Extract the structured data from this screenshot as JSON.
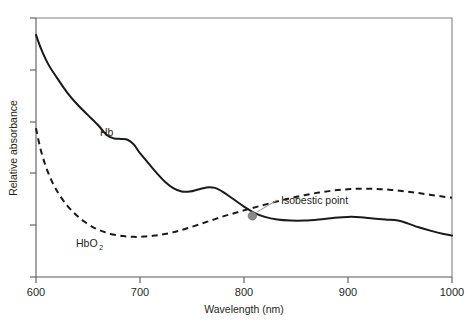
{
  "chart_data": {
    "type": "line",
    "title": "",
    "xlabel": "Wavelength (nm)",
    "ylabel": "Relative absorbance",
    "xlim": [
      600,
      1000
    ],
    "ylim": [
      0,
      1
    ],
    "grid": false,
    "legend_position": "inline-labels",
    "xticks": [
      600,
      700,
      800,
      900,
      1000
    ],
    "xtick_labels": [
      "600",
      "700",
      "800",
      "900",
      "1000"
    ],
    "ytick_count": 6,
    "ytick_labels": [],
    "series": [
      {
        "name": "Hb",
        "style": "solid",
        "color": "#1a1a1a",
        "label_text": "Hb",
        "x": [
          600,
          605,
          612,
          620,
          630,
          640,
          650,
          660,
          668,
          675,
          682,
          688,
          694,
          700,
          708,
          716,
          724,
          732,
          740,
          748,
          756,
          764,
          772,
          780,
          790,
          800,
          810,
          820,
          832,
          845,
          858,
          872,
          886,
          900,
          912,
          924,
          936,
          948,
          958,
          968,
          980,
          992,
          1000
        ],
        "y": [
          0.935,
          0.88,
          0.82,
          0.77,
          0.712,
          0.665,
          0.625,
          0.585,
          0.548,
          0.535,
          0.533,
          0.53,
          0.512,
          0.478,
          0.44,
          0.402,
          0.368,
          0.343,
          0.33,
          0.33,
          0.338,
          0.346,
          0.344,
          0.328,
          0.3,
          0.272,
          0.248,
          0.232,
          0.222,
          0.218,
          0.218,
          0.222,
          0.228,
          0.232,
          0.231,
          0.226,
          0.222,
          0.218,
          0.206,
          0.192,
          0.178,
          0.166,
          0.16
        ]
      },
      {
        "name": "HbO2",
        "style": "dashed",
        "color": "#1a1a1a",
        "label_text": "HbO",
        "label_sub": "2",
        "x": [
          600,
          604,
          609,
          615,
          622,
          630,
          638,
          646,
          655,
          664,
          674,
          684,
          694,
          704,
          714,
          724,
          734,
          744,
          756,
          768,
          780,
          792,
          804,
          816,
          830,
          844,
          858,
          872,
          886,
          900,
          914,
          928,
          942,
          956,
          968,
          980,
          992,
          1000
        ],
        "y": [
          0.575,
          0.5,
          0.432,
          0.372,
          0.32,
          0.276,
          0.242,
          0.215,
          0.192,
          0.176,
          0.164,
          0.158,
          0.155,
          0.156,
          0.16,
          0.166,
          0.175,
          0.186,
          0.202,
          0.218,
          0.234,
          0.248,
          0.262,
          0.275,
          0.29,
          0.304,
          0.316,
          0.326,
          0.334,
          0.339,
          0.341,
          0.34,
          0.336,
          0.33,
          0.324,
          0.317,
          0.31,
          0.306
        ]
      }
    ],
    "annotations": [
      {
        "name": "isobestic-point",
        "text": "Isobestic point",
        "point_x": 808,
        "point_y": 0.236,
        "marker": "filled-circle",
        "marker_color": "#8a8a8a",
        "leader_color": "#9a9a9a"
      }
    ]
  },
  "labels": {
    "xlabel": "Wavelength (nm)",
    "ylabel": "Relative absorbance",
    "hb": "Hb",
    "hbo2_base": "HbO",
    "hbo2_sub": "2",
    "annotation": "Isobestic point",
    "xtick_600": "600",
    "xtick_700": "700",
    "xtick_800": "800",
    "xtick_900": "900",
    "xtick_1000": "1000"
  }
}
